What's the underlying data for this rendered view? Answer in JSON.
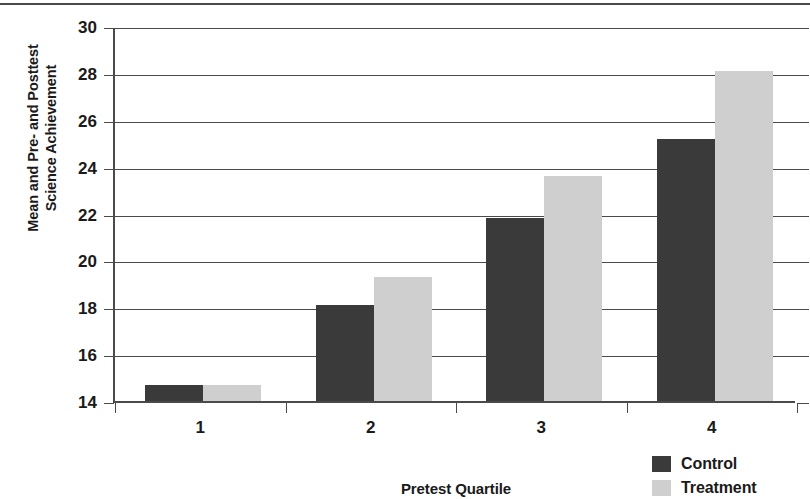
{
  "chart_data": {
    "type": "bar",
    "title": "",
    "subtitle": "",
    "xlabel": "Pretest Quartile",
    "ylabel_lines": [
      "Mean and Pre- and Posttest",
      "Science Achievement"
    ],
    "ylabel": "Mean and Pre- and Posttest Science Achievement",
    "categories": [
      "1",
      "2",
      "3",
      "4"
    ],
    "series": [
      {
        "name": "Control",
        "values": [
          14.7,
          18.1,
          21.8,
          25.2
        ],
        "color": "#3a3a3a"
      },
      {
        "name": "Treatment",
        "values": [
          14.7,
          19.3,
          23.6,
          28.1
        ],
        "color": "#cfcfcf"
      }
    ],
    "ylim": [
      14,
      30
    ],
    "yticks": [
      30,
      28,
      26,
      24,
      22,
      20,
      18,
      16,
      14
    ],
    "ytick_labels": [
      "30",
      "28",
      "26",
      "24",
      "22",
      "20",
      "18",
      "16",
      "14"
    ],
    "grid": true,
    "grid_axis": "y",
    "legend_position": "bottom-right",
    "axis_color": "#4a4a4a",
    "background": "#ffffff"
  },
  "legend": {
    "entries": [
      {
        "label": "Control",
        "color": "#3a3a3a"
      },
      {
        "label": "Treatment",
        "color": "#cfcfcf"
      }
    ]
  }
}
